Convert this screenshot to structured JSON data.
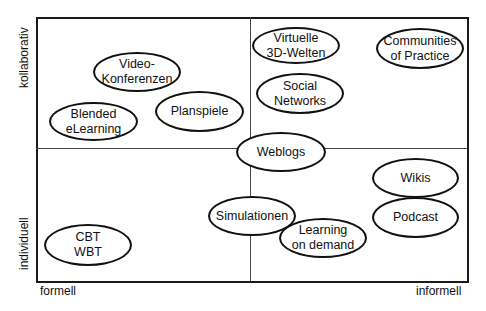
{
  "diagram": {
    "type": "quadrant",
    "axes": {
      "y_top": "kollaborativ",
      "y_bottom": "individuell",
      "x_left": "formell",
      "x_right": "informell"
    },
    "items": [
      {
        "label": "Video-\nKonferenzen",
        "quadrant": "formell-kollaborativ"
      },
      {
        "label": "Blended\neLearning",
        "quadrant": "formell-kollaborativ"
      },
      {
        "label": "Planspiele",
        "quadrant": "formell-kollaborativ"
      },
      {
        "label": "Virtuelle\n3D-Welten",
        "quadrant": "informell-kollaborativ"
      },
      {
        "label": "Communities\nof Practice",
        "quadrant": "informell-kollaborativ"
      },
      {
        "label": "Social\nNetworks",
        "quadrant": "informell-kollaborativ"
      },
      {
        "label": "Weblogs",
        "quadrant": "center"
      },
      {
        "label": "Simulationen",
        "quadrant": "center-individuell"
      },
      {
        "label": "Learning\non demand",
        "quadrant": "informell-individuell"
      },
      {
        "label": "Wikis",
        "quadrant": "informell-individuell"
      },
      {
        "label": "Podcast",
        "quadrant": "informell-individuell"
      },
      {
        "label": "CBT\nWBT",
        "quadrant": "formell-individuell"
      }
    ]
  }
}
